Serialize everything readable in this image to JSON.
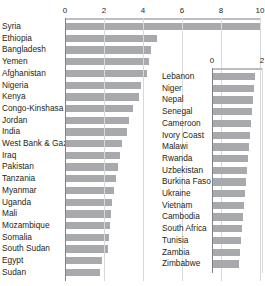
{
  "chart_data": [
    {
      "id": "left",
      "type": "bar",
      "orientation": "horizontal",
      "title": "",
      "xlabel": "",
      "ylabel": "",
      "xlim": [
        0,
        10
      ],
      "ticks": [
        0,
        2,
        4,
        6,
        8,
        10
      ],
      "tick_labels": [
        "0",
        "2",
        "4",
        "6",
        "8",
        "10"
      ],
      "grid": true,
      "axis_position": "top",
      "legend": "none",
      "bar_color": "#a7a9ac",
      "categories": [
        "Syria",
        "Ethiopia",
        "Bangladesh",
        "Yemen",
        "Afghanistan",
        "Nigeria",
        "Kenya",
        "Congo-Kinshasa",
        "Jordan",
        "India",
        "West Bank & Gaza",
        "Iraq",
        "Pakistan",
        "Tanzania",
        "Myanmar",
        "Uganda",
        "Mali",
        "Mozambique",
        "Somalia",
        "South Sudan",
        "Egypt",
        "Sudan"
      ],
      "values": [
        10.0,
        4.7,
        4.4,
        4.3,
        4.2,
        3.9,
        3.8,
        3.5,
        3.3,
        3.2,
        2.9,
        2.8,
        2.7,
        2.6,
        2.5,
        2.4,
        2.35,
        2.3,
        2.25,
        2.2,
        1.9,
        1.8
      ]
    },
    {
      "id": "right",
      "type": "bar",
      "orientation": "horizontal",
      "title": "",
      "xlabel": "",
      "ylabel": "",
      "xlim": [
        0,
        2
      ],
      "ticks": [
        0,
        2
      ],
      "tick_labels": [
        "0",
        "2"
      ],
      "grid": true,
      "axis_position": "top",
      "legend": "none",
      "bar_color": "#a7a9ac",
      "categories": [
        "Lebanon",
        "Niger",
        "Nepal",
        "Senegal",
        "Cameroon",
        "Ivory Coast",
        "Malawi",
        "Rwanda",
        "Uzbekistan",
        "Burkina Faso",
        "Ukraine",
        "Vietnam",
        "Cambodia",
        "South Africa",
        "Tunisia",
        "Zambia",
        "Zimbabwe"
      ],
      "values": [
        1.7,
        1.66,
        1.62,
        1.58,
        1.54,
        1.5,
        1.46,
        1.42,
        1.38,
        1.34,
        1.3,
        1.26,
        1.22,
        1.18,
        1.14,
        1.1,
        1.06
      ]
    }
  ]
}
